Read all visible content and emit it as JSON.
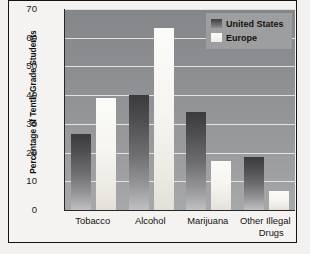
{
  "chart_data": {
    "type": "bar",
    "title": "",
    "subtitle": "",
    "xlabel": "",
    "ylabel": "Percentage of Tenth-Grade Students",
    "ylim": [
      0,
      70
    ],
    "yticks": [
      0,
      10,
      20,
      30,
      40,
      50,
      60,
      70
    ],
    "grid": true,
    "legend_position": "top-right",
    "categories": [
      "Tobacco",
      "Alcohol",
      "Marijuana",
      "Other Illegal Drugs"
    ],
    "category_lines": [
      [
        "Tobacco"
      ],
      [
        "Alcohol"
      ],
      [
        "Marijuana"
      ],
      [
        "Other Illegal",
        "Drugs"
      ]
    ],
    "series": [
      {
        "name": "United States",
        "color": "#4e4d50",
        "values": [
          26.5,
          40,
          34,
          18.5
        ]
      },
      {
        "name": "Europe",
        "color": "#f5f4ef",
        "values": [
          39,
          63.5,
          17,
          6.5
        ]
      }
    ]
  },
  "colors": {
    "plot_background": "#8e8f92",
    "gridline": "#e9e9e6",
    "axis": "#2a2724",
    "frame": "#15120f",
    "page_background": "#f2f1ef",
    "series_us": "#4e4d50",
    "series_eu": "#f5f4ef",
    "legend_background": "#9d9e9f"
  }
}
